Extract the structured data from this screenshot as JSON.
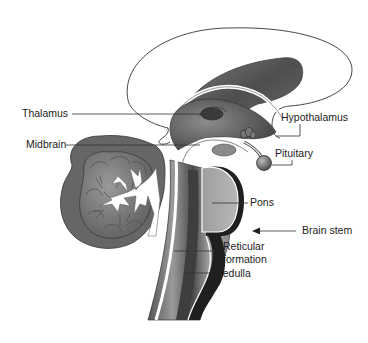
{
  "diagram": {
    "labels": {
      "thalamus": "Thalamus",
      "midbrain": "Midbrain",
      "hypothalamus": "Hypothalamus",
      "pituitary": "Pituitary",
      "pons": "Pons",
      "brain_stem": "Brain stem",
      "reticular_formation_line1": "Reticular",
      "reticular_formation_line2": "formation",
      "medulla": "Medulla"
    },
    "colors": {
      "background": "#ffffff",
      "outline": "#333333",
      "dark_tissue": "#2a2a2a",
      "mid_tissue": "#6e6e6e",
      "light_tissue": "#a8a8a8",
      "label_text": "#222222",
      "leader_line": "#333333"
    }
  }
}
